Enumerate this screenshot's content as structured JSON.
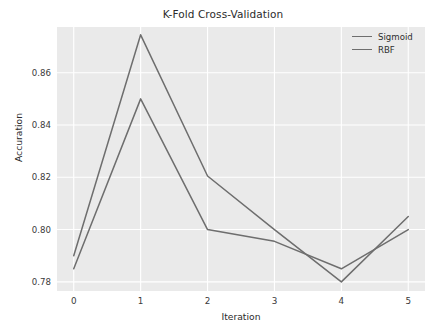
{
  "chart_data": {
    "type": "line",
    "title": "K-Fold Cross-Validation",
    "xlabel": "Iteration",
    "ylabel": "Accuration",
    "x": [
      0,
      1,
      2,
      3,
      4,
      5
    ],
    "xticks": [
      "0",
      "1",
      "2",
      "3",
      "4",
      "5"
    ],
    "yticks": [
      "0.78",
      "0.80",
      "0.82",
      "0.84",
      "0.86"
    ],
    "ytick_values": [
      0.78,
      0.8,
      0.82,
      0.84,
      0.86
    ],
    "xlim": [
      -0.25,
      5.25
    ],
    "ylim": [
      0.7765,
      0.8775
    ],
    "grid": true,
    "legend_position": "upper right",
    "series": [
      {
        "name": "Sigmoid",
        "color": "#6e6e6e",
        "values": [
          0.785,
          0.85,
          0.8,
          0.7955,
          0.785,
          0.8
        ]
      },
      {
        "name": "RBF",
        "color": "#6e6e6e",
        "values": [
          0.79,
          0.8745,
          0.8205,
          0.8,
          0.78,
          0.805
        ]
      }
    ]
  },
  "style": {
    "plot_background": "#eaeaea",
    "figure_background": "#ffffff",
    "gridline_color": "#ffffff",
    "text_color": "#2b2b2b"
  }
}
